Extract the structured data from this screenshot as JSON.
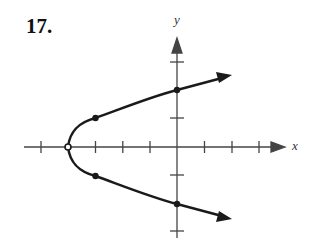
{
  "problem_number": "17.",
  "axes": {
    "x_label": "x",
    "y_label": "y",
    "x_ticks": [
      -5,
      -4,
      -3,
      -2,
      -1,
      1,
      2,
      3
    ],
    "y_ticks": [
      -3,
      -2,
      -1,
      1,
      2,
      3
    ]
  },
  "curve": {
    "description": "Horizontal parabola opening right, x = y^2 - 4",
    "vertex": {
      "x": -4,
      "y": 0,
      "style": "open"
    },
    "points": [
      {
        "x": -3,
        "y": 1
      },
      {
        "x": -3,
        "y": -1
      },
      {
        "x": 0,
        "y": 2
      },
      {
        "x": 0,
        "y": -2
      }
    ],
    "arrows": "both ends continue right"
  },
  "colors": {
    "ink": "#1a1a1a",
    "axis": "#444444",
    "background": "#ffffff"
  }
}
